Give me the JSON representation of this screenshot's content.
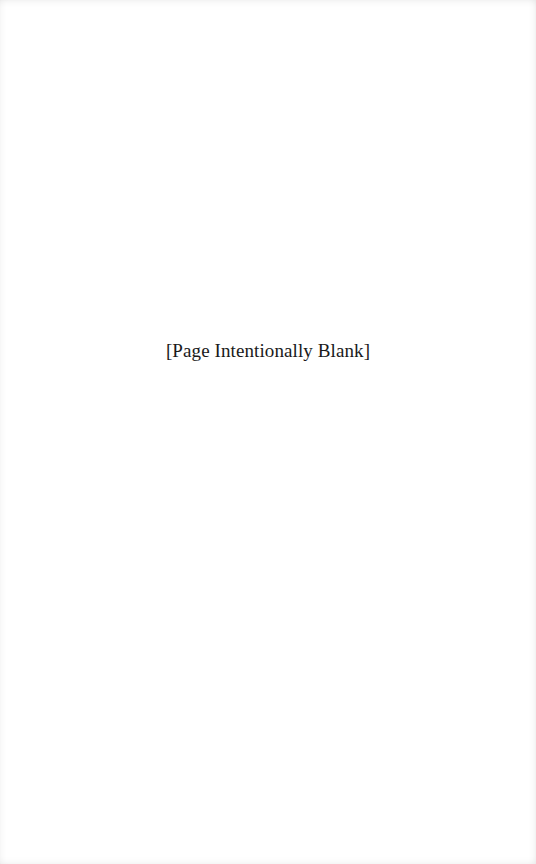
{
  "page": {
    "notice_text": "[Page Intentionally Blank]"
  }
}
